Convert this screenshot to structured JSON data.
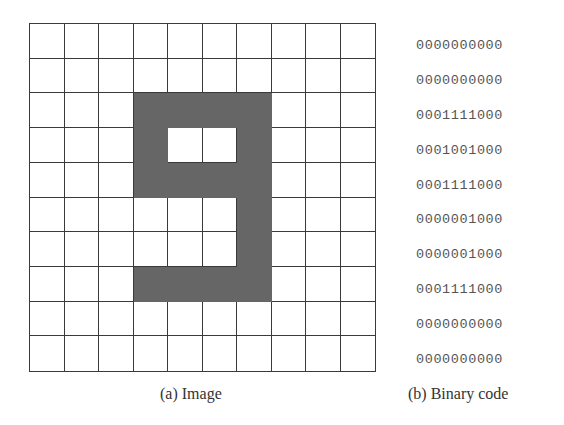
{
  "figure": {
    "image_caption": "(a) Image",
    "code_caption": "(b) Binary code",
    "fill_color": "#666666",
    "grid_line_color": "#3a3a3a",
    "grid_rows": 10,
    "grid_cols": 10,
    "binary_code": [
      "0000000000",
      "0000000000",
      "0001111000",
      "0001001000",
      "0001111000",
      "0000001000",
      "0000001000",
      "0001111000",
      "0000000000",
      "0000000000"
    ]
  }
}
